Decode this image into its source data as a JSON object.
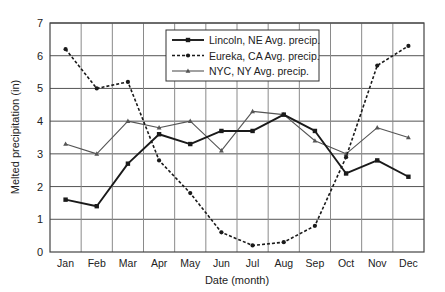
{
  "chart_data": {
    "type": "line",
    "title": "",
    "xlabel": "Date (month)",
    "ylabel": "Melted precipitation (in)",
    "ylim": [
      0,
      7
    ],
    "yticks": [
      0,
      1,
      2,
      3,
      4,
      5,
      6,
      7
    ],
    "grid": true,
    "legend_position": "upper center",
    "categories": [
      "Jan",
      "Feb",
      "Mar",
      "Apr",
      "May",
      "Jun",
      "Jul",
      "Aug",
      "Sep",
      "Oct",
      "Nov",
      "Dec"
    ],
    "series": [
      {
        "name": "Lincoln, NE  Avg. precip.",
        "style": "solid-thick",
        "marker": "square",
        "color": "#1a1a1a",
        "values": [
          1.6,
          1.4,
          2.7,
          3.6,
          3.3,
          3.7,
          3.7,
          4.2,
          3.7,
          2.4,
          2.8,
          2.3
        ]
      },
      {
        "name": "Eureka, CA  Avg. precip.",
        "style": "dashed",
        "marker": "circle",
        "color": "#1a1a1a",
        "values": [
          6.2,
          5.0,
          5.2,
          2.8,
          1.8,
          0.6,
          0.2,
          0.3,
          0.8,
          2.9,
          5.7,
          6.3
        ]
      },
      {
        "name": "NYC, NY  Avg. precip.",
        "style": "solid-thin",
        "marker": "triangle",
        "color": "#555555",
        "values": [
          3.3,
          3.0,
          4.0,
          3.8,
          4.0,
          3.1,
          4.3,
          4.2,
          3.4,
          3.0,
          3.8,
          3.5
        ]
      }
    ]
  }
}
